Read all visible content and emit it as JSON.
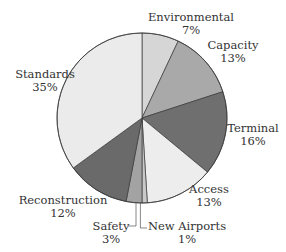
{
  "chart_data": {
    "type": "pie",
    "title": "",
    "start_angle": "12 o'clock, clockwise",
    "center": [
      142,
      118
    ],
    "radius": 85,
    "slices": [
      {
        "label": "Environmental",
        "value": 7,
        "pct_label": "7%",
        "color": "#d6d6d6"
      },
      {
        "label": "Capacity",
        "value": 13,
        "pct_label": "13%",
        "color": "#a9a9a9"
      },
      {
        "label": "Terminal",
        "value": 16,
        "pct_label": "16%",
        "color": "#6f6f6f"
      },
      {
        "label": "Access",
        "value": 13,
        "pct_label": "13%",
        "color": "#ededed"
      },
      {
        "label": "New Airports",
        "value": 1,
        "pct_label": "1%",
        "color": "#c9c9c9"
      },
      {
        "label": "Safety",
        "value": 3,
        "pct_label": "3%",
        "color": "#a3a3a3"
      },
      {
        "label": "Reconstruction",
        "value": 12,
        "pct_label": "12%",
        "color": "#6a6a6a"
      },
      {
        "label": "Standards",
        "value": 35,
        "pct_label": "35%",
        "color": "#ebebeb"
      }
    ],
    "legend": "none (labels placed around pie)"
  },
  "labels": {
    "environmental": {
      "name": "Environmental",
      "pct": "7%"
    },
    "capacity": {
      "name": "Capacity",
      "pct": "13%"
    },
    "terminal": {
      "name": "Terminal",
      "pct": "16%"
    },
    "access": {
      "name": "Access",
      "pct": "13%"
    },
    "new_airports": {
      "name": "New Airports",
      "pct": "1%"
    },
    "safety": {
      "name": "Safety",
      "pct": "3%"
    },
    "reconstruction": {
      "name": "Reconstruction",
      "pct": "12%"
    },
    "standards": {
      "name": "Standards",
      "pct": "35%"
    }
  }
}
